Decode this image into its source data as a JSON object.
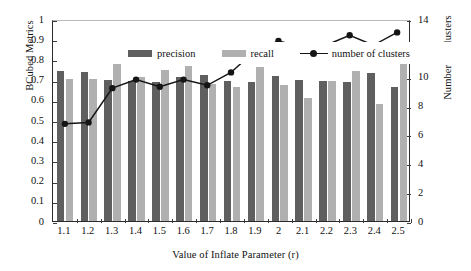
{
  "chart_data": {
    "type": "bar",
    "title": "",
    "xlabel": "Value of Inflate Parameter (r)",
    "ylabel": "BCubed Metrics",
    "y2label": "Number of Clusters",
    "categories": [
      "1.1",
      "1.2",
      "1.3",
      "1.4",
      "1.5",
      "1.6",
      "1.7",
      "1.8",
      "1.9",
      "2",
      "2.1",
      "2.2",
      "2.3",
      "2.4",
      "2.5"
    ],
    "ylim": [
      0,
      1
    ],
    "y2lim": [
      0,
      14
    ],
    "yticks": [
      "0",
      "0.1",
      "0.2",
      "0.3",
      "0.4",
      "0.5",
      "0.6",
      "0.7",
      "0.8",
      "0.9",
      "1"
    ],
    "y2ticks": [
      "0",
      "2",
      "4",
      "6",
      "8",
      "10",
      "12",
      "14"
    ],
    "grid": false,
    "legend_position": "top-left-inside",
    "series": [
      {
        "name": "precision",
        "type": "bar",
        "axis": "left",
        "color": "#5f5f5f",
        "values": [
          0.742,
          0.737,
          0.697,
          0.695,
          0.69,
          0.711,
          0.721,
          0.695,
          0.689,
          0.716,
          0.697,
          0.692,
          0.687,
          0.735,
          0.662
        ]
      },
      {
        "name": "recall",
        "type": "bar",
        "axis": "left",
        "color": "#b0b0b0",
        "values": [
          0.705,
          0.705,
          0.775,
          0.715,
          0.75,
          0.765,
          0.678,
          0.661,
          0.761,
          0.671,
          0.61,
          0.691,
          0.743,
          0.581,
          0.8
        ]
      },
      {
        "name": "number of clusters",
        "type": "line",
        "axis": "right",
        "color": "#151515",
        "marker": "circle",
        "values": [
          6.8,
          6.9,
          9.3,
          9.9,
          9.4,
          9.9,
          9.5,
          10.4,
          11.9,
          12.6,
          12.2,
          12.3,
          13.0,
          12.3,
          13.2
        ]
      }
    ]
  },
  "legend": {
    "items": [
      {
        "label": "precision",
        "marker": "bar-swatch-dark"
      },
      {
        "label": "recall",
        "marker": "bar-swatch-light"
      },
      {
        "label": "number of clusters",
        "marker": "line-with-circle"
      }
    ]
  },
  "colors": {
    "precision": "#5f5f5f",
    "recall": "#b0b0b0",
    "line": "#151515",
    "axis": "#2b2b2b",
    "background": "#ffffff"
  }
}
